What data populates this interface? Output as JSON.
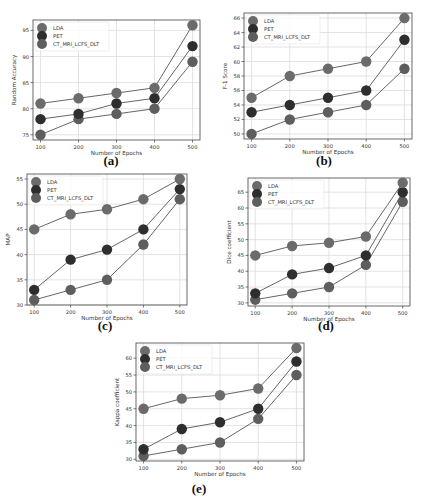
{
  "figure": {
    "legend_labels": [
      "LDA",
      "PET",
      "CT_MRI_LCFS_DLT"
    ],
    "xlabel": "Number of Epochs",
    "x_ticks": [
      100,
      200,
      300,
      400,
      500
    ]
  },
  "colors": {
    "LDA": "#6b6b6b",
    "PET": "#2e2e2e",
    "CT_MRI_LCFS_DLT": "#5e5e5e",
    "grid": "#dcdcdc",
    "axes": "#444444",
    "line": "#555555"
  },
  "chart_data": [
    {
      "id": "a",
      "caption": "(a)",
      "type": "line",
      "title": "",
      "xlabel": "Number of Epochs",
      "ylabel": "Random Accuracy",
      "x": [
        100,
        200,
        300,
        400,
        500
      ],
      "ylim": [
        74,
        97
      ],
      "y_ticks": [
        75,
        80,
        85,
        90,
        95
      ],
      "grid": true,
      "legend_position": "upper left",
      "series": [
        {
          "name": "LDA",
          "values": [
            81,
            82,
            83,
            84,
            96
          ]
        },
        {
          "name": "PET",
          "values": [
            78,
            79,
            81,
            82,
            92
          ]
        },
        {
          "name": "CT_MRI_LCFS_DLT",
          "values": [
            75,
            78,
            79,
            80,
            89
          ]
        }
      ]
    },
    {
      "id": "b",
      "caption": "(b)",
      "type": "line",
      "title": "",
      "xlabel": "Number of Epochs",
      "ylabel": "F-1 Score",
      "x": [
        100,
        200,
        300,
        400,
        500
      ],
      "ylim": [
        49.3,
        66.7
      ],
      "y_ticks": [
        50,
        52,
        54,
        56,
        58,
        60,
        62,
        64,
        66
      ],
      "grid": true,
      "legend_position": "upper left",
      "series": [
        {
          "name": "LDA",
          "values": [
            55,
            58,
            59,
            60,
            66
          ]
        },
        {
          "name": "PET",
          "values": [
            53,
            54,
            55,
            56,
            63
          ]
        },
        {
          "name": "CT_MRI_LCFS_DLT",
          "values": [
            50,
            52,
            53,
            54,
            59
          ]
        }
      ]
    },
    {
      "id": "c",
      "caption": "(c)",
      "type": "line",
      "title": "",
      "xlabel": "Number of Epochs",
      "ylabel": "MAP",
      "x": [
        100,
        200,
        300,
        400,
        500
      ],
      "ylim": [
        30,
        56
      ],
      "y_ticks": [
        30,
        35,
        40,
        45,
        50,
        55
      ],
      "grid": true,
      "legend_position": "upper left",
      "series": [
        {
          "name": "LDA",
          "values": [
            45,
            48,
            49,
            51,
            55
          ]
        },
        {
          "name": "PET",
          "values": [
            33,
            39,
            41,
            45,
            53
          ]
        },
        {
          "name": "CT_MRI_LCFS_DLT",
          "values": [
            31,
            33,
            35,
            42,
            51
          ]
        }
      ]
    },
    {
      "id": "d",
      "caption": "(d)",
      "type": "line",
      "title": "",
      "xlabel": "Number of Epochs",
      "ylabel": "Dice coefficient",
      "x": [
        100,
        200,
        300,
        400,
        500
      ],
      "ylim": [
        29,
        69.5
      ],
      "y_ticks": [
        30,
        35,
        40,
        45,
        50,
        55,
        60,
        65
      ],
      "grid": true,
      "legend_position": "upper left",
      "series": [
        {
          "name": "LDA",
          "values": [
            45,
            48,
            49,
            51,
            68
          ]
        },
        {
          "name": "PET",
          "values": [
            33,
            39,
            41,
            45,
            65
          ]
        },
        {
          "name": "CT_MRI_LCFS_DLT",
          "values": [
            31,
            33,
            35,
            42,
            62
          ]
        }
      ]
    },
    {
      "id": "e",
      "caption": "(e)",
      "type": "line",
      "title": "",
      "xlabel": "Number of Epochs",
      "ylabel": "Kappa coefficient",
      "x": [
        100,
        200,
        300,
        400,
        500
      ],
      "ylim": [
        29.5,
        64.5
      ],
      "y_ticks": [
        30,
        35,
        40,
        45,
        50,
        55,
        60
      ],
      "grid": true,
      "legend_position": "upper left",
      "series": [
        {
          "name": "LDA",
          "values": [
            45,
            48,
            49,
            51,
            63
          ]
        },
        {
          "name": "PET",
          "values": [
            33,
            39,
            41,
            45,
            59
          ]
        },
        {
          "name": "CT_MRI_LCFS_DLT",
          "values": [
            31,
            33,
            35,
            42,
            55
          ]
        }
      ]
    }
  ]
}
